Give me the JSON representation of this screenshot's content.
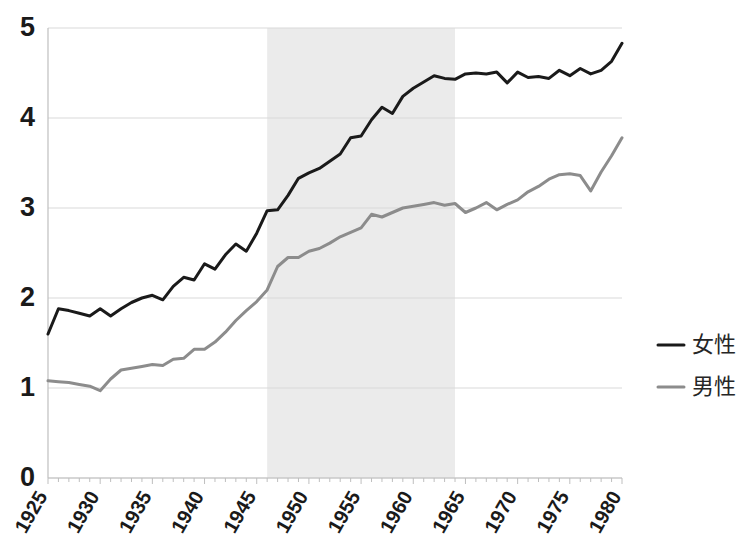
{
  "chart_data": {
    "type": "line",
    "title": "",
    "xlabel": "",
    "ylabel": "",
    "xlim": [
      1925,
      1980
    ],
    "ylim": [
      0,
      5
    ],
    "ytick_values": [
      0,
      1,
      2,
      3,
      4,
      5
    ],
    "ytick_labels": [
      "0",
      "1",
      "2",
      "3",
      "4",
      "5"
    ],
    "xtick_labels": [
      "1925",
      "1930",
      "1935",
      "1940",
      "1945",
      "1950",
      "1955",
      "1960",
      "1965",
      "1970",
      "1975",
      "1980"
    ],
    "xtick_values": [
      1925,
      1930,
      1935,
      1940,
      1945,
      1950,
      1955,
      1960,
      1965,
      1970,
      1975,
      1980
    ],
    "xtick_minor_step": 1,
    "grid": "horizontal",
    "legend_position": "right",
    "shaded_band": {
      "label": "",
      "x_start": 1946,
      "x_end": 1964,
      "color": "#ebebeb"
    },
    "x": [
      1925,
      1926,
      1927,
      1928,
      1929,
      1930,
      1931,
      1932,
      1933,
      1934,
      1935,
      1936,
      1937,
      1938,
      1939,
      1940,
      1941,
      1942,
      1943,
      1944,
      1945,
      1946,
      1947,
      1948,
      1949,
      1950,
      1951,
      1952,
      1953,
      1954,
      1955,
      1956,
      1957,
      1958,
      1959,
      1960,
      1961,
      1962,
      1963,
      1964,
      1965,
      1966,
      1967,
      1968,
      1969,
      1970,
      1971,
      1972,
      1973,
      1974,
      1975,
      1976,
      1977,
      1978,
      1979,
      1980
    ],
    "series": [
      {
        "name": "女性",
        "color": "#1a1a1a",
        "width": 3,
        "values": [
          1.6,
          1.88,
          1.86,
          1.83,
          1.8,
          1.88,
          1.8,
          1.88,
          1.95,
          2.0,
          2.03,
          1.98,
          2.13,
          2.23,
          2.2,
          2.38,
          2.32,
          2.48,
          2.6,
          2.52,
          2.72,
          2.97,
          2.98,
          3.14,
          3.33,
          3.39,
          3.44,
          3.52,
          3.6,
          3.78,
          3.8,
          3.98,
          4.12,
          4.05,
          4.24,
          4.33,
          4.4,
          4.47,
          4.44,
          4.43,
          4.49,
          4.5,
          4.49,
          4.51,
          4.39,
          4.51,
          4.45,
          4.46,
          4.44,
          4.53,
          4.47,
          4.55,
          4.49,
          4.53,
          4.63,
          4.83
        ]
      },
      {
        "name": "男性",
        "color": "#8c8c8c",
        "width": 3,
        "values": [
          1.08,
          1.07,
          1.06,
          1.04,
          1.02,
          0.97,
          1.1,
          1.2,
          1.22,
          1.24,
          1.26,
          1.25,
          1.32,
          1.33,
          1.43,
          1.43,
          1.51,
          1.62,
          1.75,
          1.86,
          1.96,
          2.09,
          2.35,
          2.45,
          2.45,
          2.52,
          2.55,
          2.61,
          2.68,
          2.73,
          2.78,
          2.93,
          2.9,
          2.95,
          3.0,
          3.02,
          3.04,
          3.06,
          3.03,
          3.05,
          2.95,
          3.0,
          3.06,
          2.98,
          3.04,
          3.09,
          3.18,
          3.24,
          3.32,
          3.37,
          3.38,
          3.36,
          3.19,
          3.4,
          3.58,
          3.78
        ]
      }
    ]
  },
  "legend": {
    "items": [
      {
        "label": "女性",
        "color": "#1a1a1a"
      },
      {
        "label": "男性",
        "color": "#8c8c8c"
      }
    ]
  },
  "axes": {
    "grid_color": "#d9d9d9",
    "axis_color": "#bfbfbf",
    "tick_color": "#bfbfbf"
  }
}
